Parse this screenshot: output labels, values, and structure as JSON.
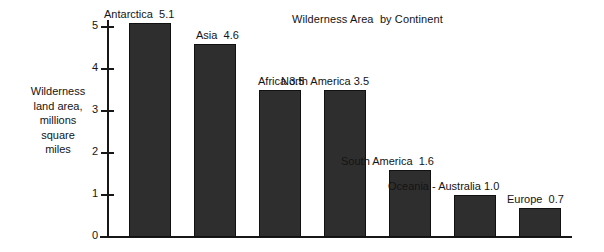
{
  "chart_data": {
    "type": "bar",
    "title": "Wilderness Area  by Continent",
    "xlabel": "",
    "ylabel": "Wilderness\nland area,\nmillions\nsquare\nmiles",
    "ylim": [
      0,
      5.4
    ],
    "yticks": [
      "0",
      "1",
      "2",
      "3",
      "4",
      "5"
    ],
    "grid": false,
    "legend": "none",
    "units": "millions of square miles",
    "categories": [
      "Antarctica",
      "Asia",
      "Africa",
      "North America",
      "South America",
      "Oceania - Australia",
      "Europe"
    ],
    "values": [
      5.1,
      4.6,
      3.5,
      3.5,
      1.6,
      1.0,
      0.7
    ],
    "bar_labels": [
      "Antarctica  5.1",
      "Asia  4.6",
      "Africa 3.5",
      "North America 3.5",
      "South America  1.6",
      "Oceania - Australia 1.0",
      "Europe  0.7"
    ],
    "bar_color": "#2e2e2e",
    "axis_color": "#171717",
    "background": "#ffffff"
  }
}
